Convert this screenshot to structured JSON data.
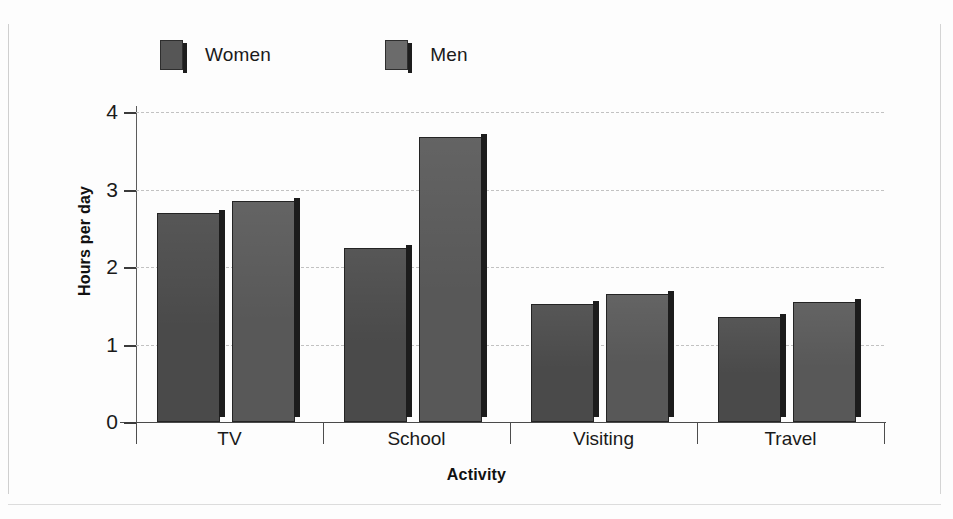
{
  "chart_data": {
    "type": "bar",
    "title": "",
    "xlabel": "Activity",
    "ylabel": "Hours per day",
    "categories": [
      "TV",
      "School",
      "Visiting",
      "Travel"
    ],
    "series": [
      {
        "name": "Women",
        "color": "#4a4a4a",
        "values": [
          2.7,
          2.25,
          1.52,
          1.35
        ]
      },
      {
        "name": "Men",
        "color": "#585858",
        "values": [
          2.85,
          3.68,
          1.65,
          1.55
        ]
      }
    ],
    "ylim": [
      0,
      4
    ],
    "yticks": [
      0,
      1,
      2,
      3,
      4
    ],
    "ytick_labels": [
      "0",
      "1",
      "2",
      "3",
      "4"
    ],
    "grid": true,
    "grid_style": "dashed",
    "grid_color": "#c2c2c2",
    "legend_position": "top-left",
    "background": "#ffffff"
  },
  "legend": {
    "items": [
      {
        "label": "Women",
        "swatch_icon": "square-swatch-icon"
      },
      {
        "label": "Men",
        "swatch_icon": "square-swatch-icon"
      }
    ]
  },
  "axes": {
    "y_title": "Hours per day",
    "x_title": "Activity",
    "y_tick_labels": [
      "4",
      "3",
      "2",
      "1",
      "0"
    ],
    "x_tick_labels": [
      "TV",
      "School",
      "Visiting",
      "Travel"
    ]
  }
}
